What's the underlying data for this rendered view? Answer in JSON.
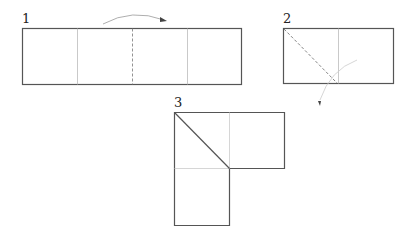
{
  "diagram": {
    "steps": [
      {
        "label": "1",
        "description": "Strip divided into four sections; fold along center dashed line"
      },
      {
        "label": "2",
        "description": "Folded rectangle with dashed diagonal fold line; fold down"
      },
      {
        "label": "3",
        "description": "L-shaped result with diagonal crease"
      }
    ]
  }
}
